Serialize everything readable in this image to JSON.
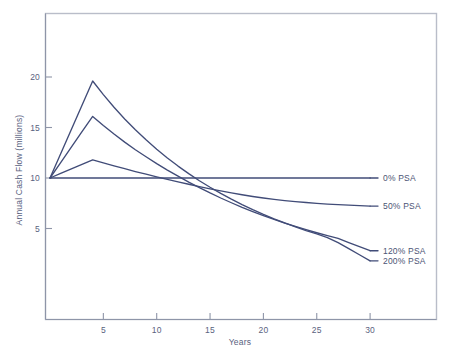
{
  "chart_data": {
    "type": "line",
    "title": "",
    "xlabel": "Years",
    "ylabel": "Annual Cash Flow (millions)",
    "xlim": [
      0,
      33
    ],
    "ylim": [
      0,
      24
    ],
    "xticks": [
      5,
      10,
      15,
      20,
      25,
      30
    ],
    "xtick_labels": [
      "5",
      "10",
      "15",
      "20",
      "25",
      "30"
    ],
    "yticks": [
      5,
      10,
      15,
      20
    ],
    "ytick_labels": [
      "5",
      "10",
      "15",
      "20"
    ],
    "grid": false,
    "legend_position": "right-inline",
    "line_color": "#414c78",
    "frame_color": "#b9bdc9",
    "text_color": "#5a6280",
    "x": [
      0,
      1,
      2,
      3,
      4,
      5,
      6,
      7,
      8,
      9,
      10,
      11,
      12,
      13,
      14,
      15,
      16,
      17,
      18,
      19,
      20,
      21,
      22,
      23,
      24,
      25,
      26,
      27,
      28,
      29,
      30
    ],
    "series": [
      {
        "name": "0% PSA",
        "label": "0% PSA",
        "values": [
          10,
          10,
          10,
          10,
          10,
          10,
          10,
          10,
          10,
          10,
          10,
          10,
          10,
          10,
          10,
          10,
          10,
          10,
          10,
          10,
          10,
          10,
          10,
          10,
          10,
          10,
          10,
          10,
          10,
          10,
          10
        ]
      },
      {
        "name": "50% PSA",
        "label": "50% PSA",
        "values": [
          10.0,
          10.45,
          10.9,
          11.35,
          11.8,
          11.5,
          11.2,
          10.92,
          10.64,
          10.38,
          10.12,
          9.87,
          9.62,
          9.38,
          9.15,
          8.93,
          8.72,
          8.52,
          8.34,
          8.17,
          8.02,
          7.88,
          7.76,
          7.66,
          7.57,
          7.49,
          7.42,
          7.36,
          7.31,
          7.26,
          7.22
        ]
      },
      {
        "name": "120% PSA",
        "label": "120% PSA",
        "values": [
          10.0,
          11.52,
          13.05,
          14.58,
          16.1,
          15.2,
          14.35,
          13.55,
          12.8,
          12.1,
          11.42,
          10.78,
          10.18,
          9.6,
          9.05,
          8.52,
          8.02,
          7.55,
          7.1,
          6.68,
          6.28,
          5.9,
          5.54,
          5.2,
          4.88,
          4.58,
          4.3,
          4.02,
          3.6,
          3.2,
          2.8
        ]
      },
      {
        "name": "200% PSA",
        "label": "200% PSA",
        "values": [
          10.0,
          12.4,
          14.8,
          17.2,
          19.6,
          18.25,
          17.0,
          15.85,
          14.78,
          13.78,
          12.85,
          11.98,
          11.18,
          10.43,
          9.73,
          9.08,
          8.47,
          7.9,
          7.37,
          6.87,
          6.4,
          5.96,
          5.55,
          5.17,
          4.8,
          4.46,
          4.1,
          3.6,
          3.0,
          2.4,
          1.8
        ]
      }
    ]
  }
}
